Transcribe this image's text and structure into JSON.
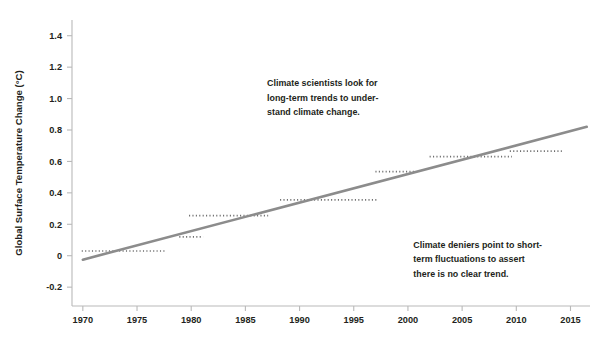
{
  "chart_data": {
    "type": "line",
    "title": "",
    "xlabel": "",
    "ylabel": "Global Surface Temperature Change (°C)",
    "xlim": [
      1969.0,
      2016.8
    ],
    "ylim": [
      -0.32,
      1.5
    ],
    "grid": false,
    "legend": null,
    "xticks": [
      1970,
      1975,
      1980,
      1985,
      1990,
      1995,
      2000,
      2005,
      2010,
      2015
    ],
    "xtick_labels": [
      "1970",
      "1975",
      "1980",
      "1985",
      "1990",
      "1995",
      "2000",
      "2005",
      "2010",
      "2015"
    ],
    "yticks": [
      -0.2,
      0,
      0.2,
      0.4,
      0.6,
      0.8,
      1.0,
      1.2,
      1.4
    ],
    "ytick_labels": [
      "-0.2",
      "0",
      "0.2",
      "0.4",
      "0.6",
      "0.8",
      "1.0",
      "1.2",
      "1.4"
    ],
    "series": [
      {
        "name": "Long-term warming trend",
        "style": "solid-line",
        "color": "#8c8c8c",
        "x": [
          1970.0,
          2016.5
        ],
        "values": [
          -0.025,
          0.82
        ]
      },
      {
        "name": "Short-term flat fluctuation segments",
        "style": "dotted-horizontal-segments",
        "color": "#6d6d6d",
        "segments": [
          {
            "x_start": 1969.9,
            "x_end": 1977.6,
            "y": 0.03
          },
          {
            "x_start": 1978.9,
            "x_end": 1981.1,
            "y": 0.12
          },
          {
            "x_start": 1979.8,
            "x_end": 1987.1,
            "y": 0.255
          },
          {
            "x_start": 1988.2,
            "x_end": 1997.1,
            "y": 0.355
          },
          {
            "x_start": 1997.0,
            "x_end": 2000.6,
            "y": 0.535
          },
          {
            "x_start": 2002.0,
            "x_end": 2009.6,
            "y": 0.63
          },
          {
            "x_start": 2009.4,
            "x_end": 2014.2,
            "y": 0.665
          }
        ]
      }
    ],
    "annotations": [
      {
        "id": "scientists-note",
        "lines": [
          "Climate scientists look for",
          "long-term trends to under-",
          "stand climate change."
        ],
        "x": 1987.0,
        "y": 1.08
      },
      {
        "id": "deniers-note",
        "lines": [
          "Climate deniers point to short-",
          "term fluctuations to assert",
          "there is no clear trend."
        ],
        "x": 2000.5,
        "y": 0.05
      }
    ]
  },
  "colors": {
    "background": "#ffffff",
    "axis": "#b9b9b9",
    "text": "#231f20",
    "trend_line": "#8c8c8c",
    "dotted_segments": "#6d6d6d"
  }
}
